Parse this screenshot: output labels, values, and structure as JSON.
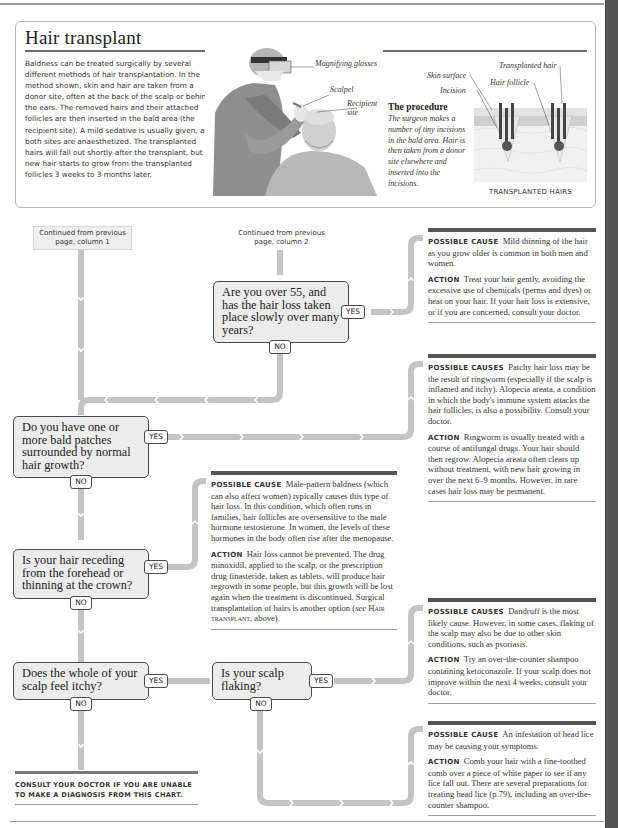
{
  "hair_transplant": {
    "title": "Hair transplant",
    "body": "Baldness can be treated surgically by several different methods of hair transplantation. In the method shown, skin and hair are taken from a donor site, often at the back of the scalp or behind the ears. The removed hairs and their attached follicles are then inserted in the bald area (the recipient site). A mild sedative is usually given, and both sites are anaesthetized. The transplanted hairs will fall out shortly after the transplant, but new hair starts to grow from the transplanted follicles 3 weeks to 3 months later.",
    "photo_labels": {
      "magnifying_glasses": "Magnifying glasses",
      "scalpel": "Scalpel",
      "recipient_site": "Recipient site"
    },
    "procedure": {
      "title": "The procedure",
      "body": "The surgeon makes a number of tiny incisions in the bald area. Hair is then taken from a donor site elsewhere and inserted into the incisions."
    },
    "diagram_labels": {
      "skin_surface": "Skin surface",
      "incision": "Incision",
      "hair_follicle": "Hair follicle",
      "transplanted_hair": "Transplanted hair"
    },
    "diagram_caption": "TRANSPLANTED HAIRS"
  },
  "flowchart": {
    "continued": [
      "Continued from previous page, column 1",
      "Continued from previous page, column 2"
    ],
    "yes_label": "YES",
    "no_label": "NO",
    "questions": [
      "Are you over 55, and has the hair loss taken place slowly over many years?",
      "Do you have one or more bald patches surrounded by normal hair growth?",
      "Is your hair receding from the forehead or thinning at the crown?",
      "Does the whole of your scalp feel itchy?",
      "Is your scalp flaking?"
    ],
    "answers": [
      {
        "cause_label": "Possible cause",
        "cause": "Mild thinning of the hair as you grow older is common in both men and women.",
        "action_label": "Action",
        "action": "Treat your hair gently, avoiding the excessive use of chemicals (perms and dyes) or heat on your hair. If your hair loss is extensive, or if you are concerned, consult your doctor."
      },
      {
        "cause_label": "Possible causes",
        "cause": "Patchy hair loss may be the result of ringworm (especially if the scalp is inflamed and itchy). Alopecia areata, a condition in which the body's immune system attacks the hair follicles, is also a possibility. Consult your doctor.",
        "action_label": "Action",
        "action": "Ringworm is usually treated with a course of antifungal drugs. Your hair should then regrow. Alopecia areata often clears up without treatment, with new hair growing in over the next 6–9 months. However, in rare cases hair loss may be permanent."
      },
      {
        "cause_label": "Possible cause",
        "cause": "Male-pattern baldness (which can also affect women) typically causes this type of hair loss. In this condition, which often runs in families, hair follicles are oversensitive to the male hormone testosterone. In women, the levels of these hormones in the body often rise after the menopause.",
        "action_label": "Action",
        "action_pre": "Hair loss cannot be prevented. The drug minoxidil, applied to the scalp, or the prescription drug finasteride, taken as tablets, will produce hair regrowth in some people, but this growth will be lost again when the treatment is discontinued. Surgical transplantation of hairs is another option (",
        "action_see": "see",
        "action_ref": "Hair transplant",
        "action_post": ", above)."
      },
      {
        "cause_label": "Possible causes",
        "cause": "Dandruff is the most likely cause. However, in some cases, flaking of the scalp may also be due to other skin conditions, such as psoriasis.",
        "action_label": "Action",
        "action": "Try an over-the-counter shampoo containing ketoconazole. If your scalp does not improve within the next 4 weeks, consult your doctor."
      },
      {
        "cause_label": "Possible cause",
        "cause": "An infestation of head lice may be causing your symptoms.",
        "action_label": "Action",
        "action": "Comb your hair with a fine-toothed comb over a piece of white paper to see if any lice fall out. There are several preparations for treating head lice (p.79), including an over-the-counter shampoo."
      }
    ],
    "consult_note": "Consult your doctor if you are unable to make a diagnosis from this chart."
  },
  "colors": {
    "connector": "#c4c4c4",
    "box_fill": "#ececec",
    "box_border": "#4a4a4a",
    "rule_dark": "#555555",
    "side_tab": "#555555"
  }
}
